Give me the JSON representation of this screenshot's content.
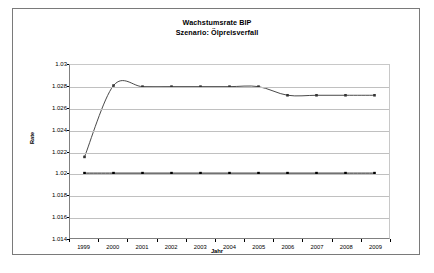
{
  "chart_data": {
    "type": "line",
    "title": "Wachstumsrate BIP",
    "subtitle": "Szenario: Ölpreisverfall",
    "xlabel": "Jahr",
    "ylabel": "Rate",
    "categories": [
      "1999",
      "2000",
      "2001",
      "2002",
      "2003",
      "2004",
      "2005",
      "2006",
      "2007",
      "2008",
      "2009"
    ],
    "ylim": [
      1.014,
      1.03
    ],
    "yticks": [
      "1.014",
      "1.016",
      "1.018",
      "1.02",
      "1.022",
      "1.024",
      "1.026",
      "1.028",
      "1.03"
    ],
    "ytick_values": [
      1.014,
      1.016,
      1.018,
      1.02,
      1.022,
      1.024,
      1.026,
      1.028,
      1.03
    ],
    "grid": true,
    "legend": "none",
    "series": [
      {
        "name": "Basisszenario",
        "marker": "diamond",
        "color": "#000000",
        "values": [
          1.02,
          1.02,
          1.02,
          1.02,
          1.02,
          1.02,
          1.02,
          1.02,
          1.02,
          1.02,
          1.02
        ]
      },
      {
        "name": "Ölpreisverfall",
        "marker": "square",
        "color": "#333333",
        "values": [
          1.0215,
          1.0281,
          1.028,
          1.028,
          1.028,
          1.028,
          1.028,
          1.0272,
          1.0272,
          1.0272,
          1.0272
        ]
      }
    ]
  }
}
